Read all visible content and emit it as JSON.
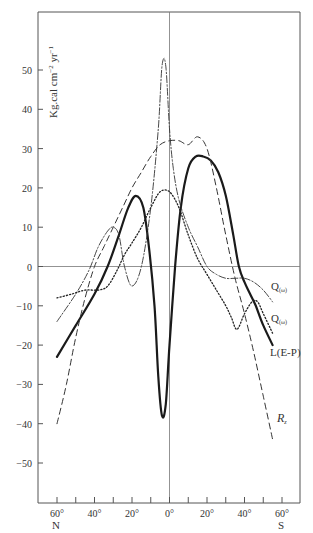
{
  "chart_data": {
    "type": "line",
    "title": "",
    "xlabel": "Latitude",
    "ylabel": "Kg.cal cm⁻² yr⁻¹",
    "ylabel_parts": {
      "main": "Kg.cal cm",
      "sup1": "−2",
      "mid": " yr",
      "sup2": "−1"
    },
    "xlim": [
      -70,
      70
    ],
    "ylim": [
      -60,
      60
    ],
    "x_ticks": [
      -60,
      -50,
      -40,
      -30,
      -20,
      -10,
      0,
      10,
      20,
      30,
      40,
      50,
      60
    ],
    "x_tick_labels": [
      {
        "value": -60,
        "label": "60°",
        "sub": "N"
      },
      {
        "value": -40,
        "label": "40°",
        "sub": ""
      },
      {
        "value": -20,
        "label": "20°",
        "sub": ""
      },
      {
        "value": 0,
        "label": "0°",
        "sub": ""
      },
      {
        "value": 20,
        "label": "20°",
        "sub": ""
      },
      {
        "value": 40,
        "label": "40°",
        "sub": ""
      },
      {
        "value": 60,
        "label": "60°",
        "sub": "S"
      }
    ],
    "y_ticks": [
      50,
      40,
      30,
      20,
      10,
      0,
      -10,
      -20,
      -30,
      -40,
      -50
    ],
    "y_tick_labels": [
      "50",
      "40",
      "30",
      "20",
      "10",
      "0",
      "−10",
      "−20",
      "−30",
      "−40",
      "−50"
    ],
    "grid": false,
    "zero_lines": true,
    "series": [
      {
        "name": "L(E-P)",
        "style": "solid-thick",
        "x": [
          -60,
          -50,
          -40,
          -33,
          -27,
          -22,
          -18,
          -14,
          -11,
          -8,
          -6,
          -4,
          -2,
          0,
          3,
          6,
          10,
          14,
          18,
          22,
          26,
          30,
          34,
          37,
          40,
          43,
          46,
          50,
          55
        ],
        "y": [
          -23,
          -15,
          -7,
          0,
          8,
          15,
          18,
          15,
          5,
          -10,
          -28,
          -38,
          -35,
          -20,
          0,
          15,
          25,
          28,
          28,
          27,
          24,
          18,
          8,
          0,
          -4,
          -7,
          -10,
          -15,
          -20
        ]
      },
      {
        "name": "Q(ω) upper / dash-dot",
        "label": "Qᵤᵥ",
        "style": "dash-dot",
        "x": [
          -60,
          -50,
          -43,
          -38,
          -33,
          -30,
          -27,
          -24,
          -20,
          -15,
          -10,
          -6,
          -4,
          -2,
          0,
          2,
          5,
          10,
          15,
          20,
          25,
          30,
          35,
          40,
          45,
          50,
          55
        ],
        "y": [
          -14,
          -7,
          -1,
          5,
          9,
          10,
          8,
          0,
          -5,
          0,
          15,
          35,
          51,
          51,
          35,
          25,
          17,
          10,
          5,
          0,
          -2,
          -3,
          -3,
          -3,
          -4,
          -6,
          -9
        ]
      },
      {
        "name": "Q(ω) lower / dotted",
        "label": "Qᵤᵥ",
        "style": "dotted",
        "x": [
          -60,
          -52,
          -45,
          -38,
          -33,
          -28,
          -24,
          -20,
          -15,
          -10,
          -5,
          0,
          5,
          10,
          15,
          20,
          25,
          30,
          33,
          36,
          40,
          44,
          47,
          50,
          55
        ],
        "y": [
          -8,
          -7,
          -6,
          -6,
          -5,
          -1,
          3,
          6,
          10,
          15,
          19,
          19,
          15,
          8,
          2,
          -2,
          -6,
          -10,
          -13,
          -16,
          -12,
          -9,
          -9,
          -12,
          -17
        ]
      },
      {
        "name": "R_z",
        "label": "R₂",
        "style": "dashed",
        "x": [
          -60,
          -55,
          -50,
          -45,
          -40,
          -35,
          -30,
          -25,
          -20,
          -15,
          -10,
          -5,
          0,
          5,
          10,
          15,
          20,
          25,
          30,
          35,
          40,
          45,
          50,
          55
        ],
        "y": [
          -40,
          -30,
          -18,
          -8,
          0,
          5,
          10,
          15,
          20,
          24,
          28,
          31,
          32,
          32,
          31,
          33,
          30,
          20,
          8,
          -3,
          -12,
          -22,
          -33,
          -44
        ]
      }
    ],
    "legend": {
      "position": "inline-right",
      "entries": [
        {
          "text": "Q",
          "sub": "(ω)",
          "series": "dash-dot"
        },
        {
          "text": "Q",
          "sub": "(ω)",
          "series": "dotted"
        },
        {
          "text": "L(E-P)",
          "sub": "",
          "series": "solid"
        },
        {
          "text": "R",
          "sub": "z",
          "series": "dashed"
        }
      ]
    }
  }
}
